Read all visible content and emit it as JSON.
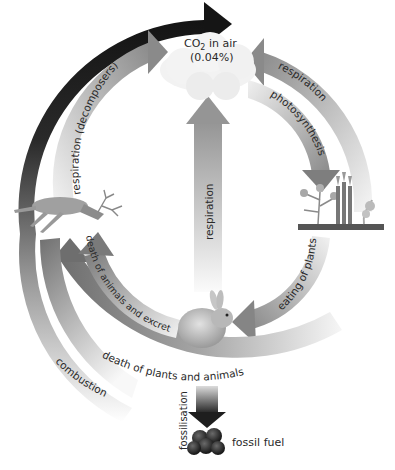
{
  "nodes": {
    "co2": {
      "line1": "CO",
      "sub": "2",
      "line1_suffix": " in air",
      "line2": "(0.04%)"
    },
    "fossil_fuel": "fossil fuel"
  },
  "processes": {
    "respiration_decomposers": "respiration (decomposers)",
    "respiration_plants": "respiration",
    "photosynthesis": "photosynthesis",
    "respiration_center": "respiration",
    "death_animals_excretion": "death of animals and excretion",
    "eating_of_plants": "eating of plants",
    "death_plants_animals": "death of plants and animals",
    "combustion": "combustion",
    "fossilisation": "fossilisation"
  },
  "colors": {
    "dark_arrow": "#1c1c1c",
    "mid_arrow": "#7a7a7a",
    "light_arrow": "#d8d8d8"
  }
}
